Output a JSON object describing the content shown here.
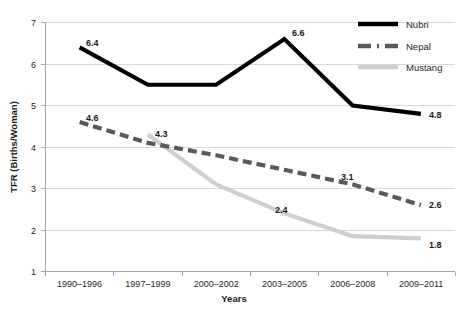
{
  "chart_data": {
    "type": "line",
    "title": "",
    "xlabel": "Years",
    "ylabel": "TFR (Births/Woman)",
    "categories": [
      "1990–1996",
      "1997–1999",
      "2000–2002",
      "2003–2005",
      "2006–2008",
      "2009–2011"
    ],
    "ylim": [
      1,
      7
    ],
    "yticks": [
      1,
      2,
      3,
      4,
      5,
      6,
      7
    ],
    "grid": true,
    "legend_position": "top-right",
    "series": [
      {
        "name": "Nubri",
        "color": "#000000",
        "style": "solid",
        "values": [
          6.4,
          5.5,
          5.5,
          6.6,
          5.0,
          4.8
        ],
        "labels": [
          {
            "category": "1990–1996",
            "value": 6.4,
            "text": "6.4"
          },
          {
            "category": "2003–2005",
            "value": 6.6,
            "text": "6.6"
          },
          {
            "category": "2009–2011",
            "value": 4.8,
            "text": "4.8"
          }
        ]
      },
      {
        "name": "Nepal",
        "color": "#595959",
        "style": "dashed",
        "values": [
          4.6,
          4.1,
          3.8,
          3.45,
          3.1,
          2.6
        ],
        "labels": [
          {
            "category": "1990–1996",
            "value": 4.6,
            "text": "4.6"
          },
          {
            "category": "2006–2008",
            "value": 3.1,
            "text": "3.1"
          },
          {
            "category": "2009–2011",
            "value": 2.6,
            "text": "2.6"
          }
        ]
      },
      {
        "name": "Mustang",
        "color": "#cfcfcf",
        "style": "solid",
        "values": [
          null,
          4.3,
          3.1,
          2.4,
          1.85,
          1.8
        ],
        "labels": [
          {
            "category": "1997–1999",
            "value": 4.3,
            "text": "4.3"
          },
          {
            "category": "2003–2005",
            "value": 2.4,
            "text": "2.4"
          },
          {
            "category": "2009–2011",
            "value": 1.8,
            "text": "1.8"
          }
        ]
      }
    ]
  },
  "axis": {
    "y_title": "TFR (Births/Woman)",
    "x_title": "Years",
    "y_ticks": [
      "7",
      "6",
      "5",
      "4",
      "3",
      "2",
      "1"
    ],
    "x_ticks": [
      "1990–1996",
      "1997–1999",
      "2000–2002",
      "2003–2005",
      "2006–2008",
      "2009–2011"
    ]
  },
  "legend": {
    "items": [
      {
        "label": "Nubri",
        "color": "#000000",
        "style": "solid"
      },
      {
        "label": "Nepal",
        "color": "#595959",
        "style": "dashed"
      },
      {
        "label": "Mustang",
        "color": "#cfcfcf",
        "style": "solid"
      }
    ]
  },
  "data_labels": {
    "nubri_first": "6.4",
    "nubri_peak": "6.6",
    "nubri_last": "4.8",
    "nepal_first": "4.6",
    "nepal_fifth": "3.1",
    "nepal_last": "2.6",
    "mustang_first": "4.3",
    "mustang_fourth": "2.4",
    "mustang_last": "1.8"
  },
  "colors": {
    "nubri": "#000000",
    "nepal": "#595959",
    "mustang": "#cfcfcf",
    "grid": "#d9d9d9",
    "axis": "#a6a6a6",
    "text": "#262626",
    "background": "#ffffff"
  }
}
